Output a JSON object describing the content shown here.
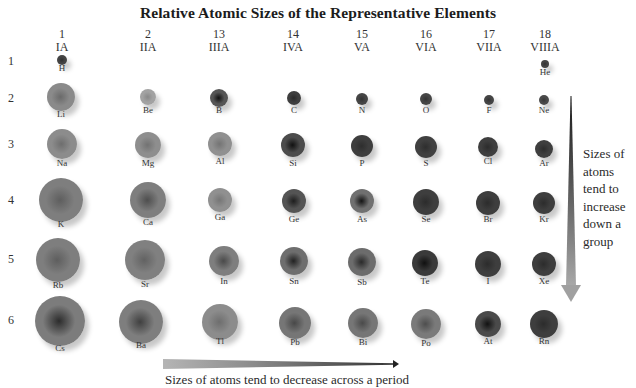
{
  "title": "Relative Atomic Sizes of the Representative Elements",
  "groups": [
    {
      "number": "1",
      "roman": "IA",
      "x": 62
    },
    {
      "number": "2",
      "roman": "IIA",
      "x": 148
    },
    {
      "number": "13",
      "roman": "IIIA",
      "x": 219
    },
    {
      "number": "14",
      "roman": "IVA",
      "x": 293
    },
    {
      "number": "15",
      "roman": "VA",
      "x": 362
    },
    {
      "number": "16",
      "roman": "VIA",
      "x": 426
    },
    {
      "number": "17",
      "roman": "VIIA",
      "x": 489
    },
    {
      "number": "18",
      "roman": "VIIIA",
      "x": 545
    }
  ],
  "periods": [
    {
      "label": "1",
      "y": 62
    },
    {
      "label": "2",
      "y": 99
    },
    {
      "label": "3",
      "y": 145
    },
    {
      "label": "4",
      "y": 201
    },
    {
      "label": "5",
      "y": 260
    },
    {
      "label": "6",
      "y": 321
    }
  ],
  "elements": [
    {
      "symbol": "H",
      "cx": 62,
      "cy": 60,
      "r": 5,
      "color": "#444444",
      "core": "#303030",
      "label_y": 68
    },
    {
      "symbol": "He",
      "cx": 545,
      "cy": 64,
      "r": 4,
      "color": "#444444",
      "core": "#333333",
      "label_y": 72
    },
    {
      "symbol": "Li",
      "cx": 61,
      "cy": 97,
      "r": 14,
      "color": "#8a8a8a",
      "core": "#6a6a6a",
      "label_y": 114
    },
    {
      "symbol": "Be",
      "cx": 148,
      "cy": 97,
      "r": 8,
      "color": "#a2a2a2",
      "core": "#888888",
      "label_y": 110
    },
    {
      "symbol": "B",
      "cx": 219,
      "cy": 98,
      "r": 9,
      "color": "#555555",
      "core": "#111111",
      "label_y": 110
    },
    {
      "symbol": "C",
      "cx": 294,
      "cy": 98,
      "r": 7,
      "color": "#3e3e3e",
      "core": "#2a2a2a",
      "label_y": 110
    },
    {
      "symbol": "N",
      "cx": 362,
      "cy": 99,
      "r": 6,
      "color": "#454545",
      "core": "#333333",
      "label_y": 110
    },
    {
      "symbol": "O",
      "cx": 426,
      "cy": 99,
      "r": 6,
      "color": "#454545",
      "core": "#333333",
      "label_y": 110
    },
    {
      "symbol": "F",
      "cx": 489,
      "cy": 100,
      "r": 5,
      "color": "#454545",
      "core": "#333333",
      "label_y": 110
    },
    {
      "symbol": "Ne",
      "cx": 544,
      "cy": 100,
      "r": 5,
      "color": "#4a4a4a",
      "core": "#383838",
      "label_y": 110
    },
    {
      "symbol": "Na",
      "cx": 62,
      "cy": 144,
      "r": 15,
      "color": "#8c8c8c",
      "core": "#6e6e6e",
      "label_y": 163
    },
    {
      "symbol": "Mg",
      "cx": 148,
      "cy": 145,
      "r": 13,
      "color": "#8e8e8e",
      "core": "#727272",
      "label_y": 163
    },
    {
      "symbol": "Al",
      "cx": 220,
      "cy": 144,
      "r": 12,
      "color": "#909090",
      "core": "#747474",
      "label_y": 161
    },
    {
      "symbol": "Si",
      "cx": 293,
      "cy": 145,
      "r": 12,
      "color": "#4c4c4c",
      "core": "#111111",
      "label_y": 163
    },
    {
      "symbol": "P",
      "cx": 362,
      "cy": 146,
      "r": 11,
      "color": "#3e3e3e",
      "core": "#2e2e2e",
      "label_y": 163
    },
    {
      "symbol": "S",
      "cx": 426,
      "cy": 147,
      "r": 11,
      "color": "#404040",
      "core": "#2e2e2e",
      "label_y": 163
    },
    {
      "symbol": "Cl",
      "cx": 488,
      "cy": 147,
      "r": 10,
      "color": "#3e3e3e",
      "core": "#2c2c2c",
      "label_y": 161
    },
    {
      "symbol": "Ar",
      "cx": 544,
      "cy": 149,
      "r": 9,
      "color": "#3e3e3e",
      "core": "#2c2c2c",
      "label_y": 163
    },
    {
      "symbol": "K",
      "cx": 61,
      "cy": 200,
      "r": 22,
      "color": "#7e7e7e",
      "core": "#5e5e5e",
      "label_y": 224
    },
    {
      "symbol": "Ca",
      "cx": 148,
      "cy": 200,
      "r": 18,
      "color": "#7e7e7e",
      "core": "#4e4e4e",
      "label_y": 222
    },
    {
      "symbol": "Ga",
      "cx": 220,
      "cy": 200,
      "r": 12,
      "color": "#909090",
      "core": "#767676",
      "label_y": 217
    },
    {
      "symbol": "Ge",
      "cx": 294,
      "cy": 201,
      "r": 12,
      "color": "#545454",
      "core": "#1e1e1e",
      "label_y": 219
    },
    {
      "symbol": "As",
      "cx": 362,
      "cy": 201,
      "r": 12,
      "color": "#707070",
      "core": "#141414",
      "label_y": 219
    },
    {
      "symbol": "Se",
      "cx": 426,
      "cy": 202,
      "r": 13,
      "color": "#3e3e3e",
      "core": "#2c2c2c",
      "label_y": 219
    },
    {
      "symbol": "Br",
      "cx": 488,
      "cy": 203,
      "r": 12,
      "color": "#3e3e3e",
      "core": "#2c2c2c",
      "label_y": 219
    },
    {
      "symbol": "Kr",
      "cx": 544,
      "cy": 203,
      "r": 11,
      "color": "#3e3e3e",
      "core": "#2c2c2c",
      "label_y": 219
    },
    {
      "symbol": "Rb",
      "cx": 58,
      "cy": 260,
      "r": 22,
      "color": "#7e7e7e",
      "core": "#5e5e5e",
      "label_y": 285
    },
    {
      "symbol": "Sr",
      "cx": 145,
      "cy": 260,
      "r": 20,
      "color": "#808080",
      "core": "#626262",
      "label_y": 284
    },
    {
      "symbol": "In",
      "cx": 224,
      "cy": 261,
      "r": 15,
      "color": "#7e7e7e",
      "core": "#4a4a4a",
      "label_y": 281
    },
    {
      "symbol": "Sn",
      "cx": 294,
      "cy": 261,
      "r": 14,
      "color": "#6e6e6e",
      "core": "#222222",
      "label_y": 281
    },
    {
      "symbol": "Sb",
      "cx": 362,
      "cy": 262,
      "r": 14,
      "color": "#6c6c6c",
      "core": "#2a2a2a",
      "label_y": 282
    },
    {
      "symbol": "Te",
      "cx": 425,
      "cy": 263,
      "r": 13,
      "color": "#3a3a3a",
      "core": "#101010",
      "label_y": 281
    },
    {
      "symbol": "I",
      "cx": 488,
      "cy": 264,
      "r": 13,
      "color": "#3e3e3e",
      "core": "#2c2c2c",
      "label_y": 281
    },
    {
      "symbol": "Xe",
      "cx": 544,
      "cy": 264,
      "r": 12,
      "color": "#3e3e3e",
      "core": "#2c2c2c",
      "label_y": 281
    },
    {
      "symbol": "Cs",
      "cx": 60,
      "cy": 321,
      "r": 25,
      "color": "#7c7c7c",
      "core": "#2c2c2c",
      "label_y": 348
    },
    {
      "symbol": "Ba",
      "cx": 141,
      "cy": 322,
      "r": 22,
      "color": "#7e7e7e",
      "core": "#404040",
      "label_y": 345
    },
    {
      "symbol": "Tl",
      "cx": 220,
      "cy": 322,
      "r": 18,
      "color": "#8c8c8c",
      "core": "#6e6e6e",
      "label_y": 341
    },
    {
      "symbol": "Pb",
      "cx": 295,
      "cy": 323,
      "r": 16,
      "color": "#767676",
      "core": "#484848",
      "label_y": 342
    },
    {
      "symbol": "Bi",
      "cx": 363,
      "cy": 323,
      "r": 15,
      "color": "#767676",
      "core": "#4a4a4a",
      "label_y": 342
    },
    {
      "symbol": "Po",
      "cx": 426,
      "cy": 324,
      "r": 15,
      "color": "#7a7a7a",
      "core": "#4e4e4e",
      "label_y": 343
    },
    {
      "symbol": "At",
      "cx": 488,
      "cy": 324,
      "r": 13,
      "color": "#4a4a4a",
      "core": "#121212",
      "label_y": 341
    },
    {
      "symbol": "Rn",
      "cx": 544,
      "cy": 324,
      "r": 14,
      "color": "#3e3e3e",
      "core": "#2c2c2c",
      "label_y": 341
    }
  ],
  "annotations": {
    "group_trend": "Sizes of atoms tend to increase down a group",
    "period_trend": "Sizes of atoms tend to decrease across a period"
  }
}
